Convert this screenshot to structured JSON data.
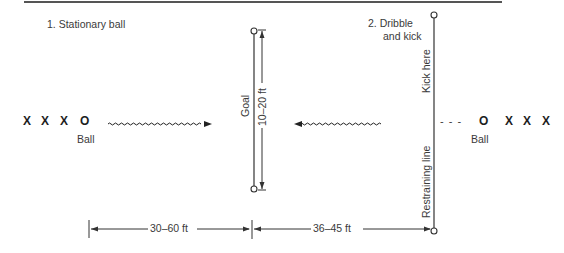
{
  "diagram": {
    "sections": [
      {
        "id": 1,
        "label": "1. Stationary ball"
      },
      {
        "id": 2,
        "label_line1": "2. Dribble",
        "label_line2": "and kick"
      }
    ],
    "left_group": {
      "players": [
        "X",
        "X",
        "X"
      ],
      "ball_symbol": "O",
      "ball_label": "Ball"
    },
    "right_group": {
      "players": [
        "X",
        "X",
        "X"
      ],
      "ball_symbol": "O",
      "ball_label": "Ball",
      "dribble_path": "- - -"
    },
    "goal": {
      "label": "Goal",
      "width_label": "10–20 ft"
    },
    "restraining_line": {
      "top_label": "Kick here",
      "bottom_label": "Restraining line"
    },
    "dimensions": [
      {
        "label": "30–60 ft",
        "from": "stationary-ball-start",
        "to": "goal"
      },
      {
        "label": "36–45 ft",
        "from": "goal",
        "to": "restraining-line"
      }
    ],
    "colors": {
      "line": "#3a3a3a",
      "text": "#3a3a3a",
      "background": "#ffffff"
    }
  }
}
